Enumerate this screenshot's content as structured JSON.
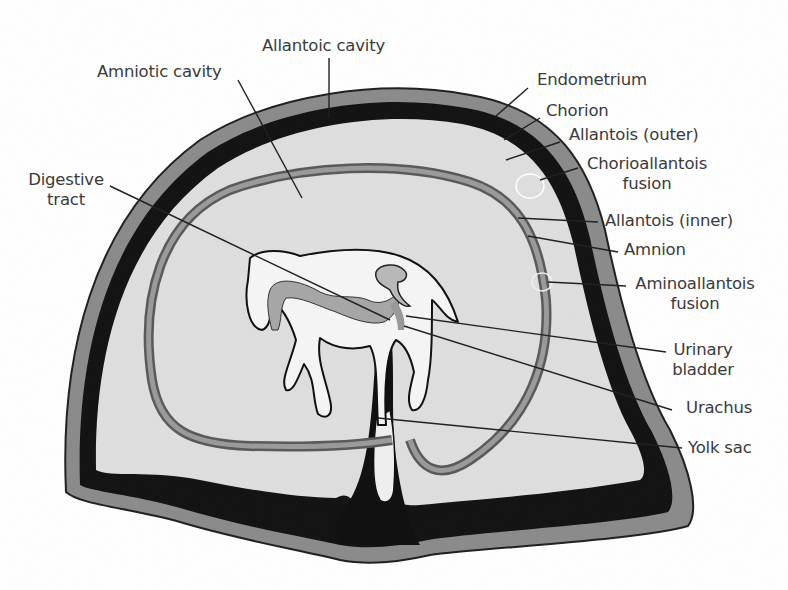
{
  "figure": {
    "type": "anatomical cross-section"
  },
  "labels": {
    "allantoic_cavity": "Allantoic cavity",
    "amniotic_cavity": "Amniotic cavity",
    "digestive_tract_line1": "Digestive",
    "digestive_tract_line2": "tract",
    "endometrium": "Endometrium",
    "chorion": "Chorion",
    "allantois_outer": "Allantois (outer)",
    "chorioallantois_line1": "Chorioallantois",
    "chorioallantois_line2": "fusion",
    "allantois_inner": "Allantois (inner)",
    "amnion": "Amnion",
    "aminoallantois_line1": "Aminoallantois",
    "aminoallantois_line2": "fusion",
    "urinary_line1": "Urinary",
    "urinary_line2": "bladder",
    "urachus": "Urachus",
    "yolk_sac": "Yolk sac"
  },
  "colors": {
    "endometrium": "#8a8a8a",
    "chorion": "#111111",
    "allantoic_fluid": "#dedede",
    "amnion": "#6f6f6f",
    "fetus": "#f4f4f4",
    "fetal_organs": "#a6a6a6",
    "leader_line": "#222222",
    "text": "#3a3a3a"
  }
}
